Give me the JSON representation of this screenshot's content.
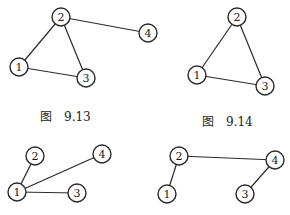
{
  "figures": [
    {
      "id": "fig-9-13",
      "caption_prefix": "图",
      "caption_number": "9.13",
      "caption_pos": [
        40,
        107
      ],
      "nodes": [
        {
          "label": "1",
          "x": 19,
          "y": 67
        },
        {
          "label": "2",
          "x": 61,
          "y": 17
        },
        {
          "label": "3",
          "x": 86,
          "y": 78
        },
        {
          "label": "4",
          "x": 148,
          "y": 33
        }
      ],
      "edges": [
        [
          "1",
          "2"
        ],
        [
          "2",
          "3"
        ],
        [
          "1",
          "3"
        ],
        [
          "2",
          "4"
        ]
      ]
    },
    {
      "id": "fig-9-14",
      "caption_prefix": "图",
      "caption_number": "9.14",
      "caption_pos": [
        202,
        112
      ],
      "nodes": [
        {
          "label": "1",
          "x": 197,
          "y": 75
        },
        {
          "label": "2",
          "x": 237,
          "y": 17
        },
        {
          "label": "3",
          "x": 265,
          "y": 86
        }
      ],
      "edges": [
        [
          "1",
          "2"
        ],
        [
          "2",
          "3"
        ],
        [
          "1",
          "3"
        ]
      ]
    },
    {
      "id": "fig-bottom-left",
      "nodes": [
        {
          "label": "1",
          "x": 17,
          "y": 192
        },
        {
          "label": "2",
          "x": 35,
          "y": 156
        },
        {
          "label": "3",
          "x": 77,
          "y": 193
        },
        {
          "label": "4",
          "x": 102,
          "y": 154
        }
      ],
      "edges": [
        [
          "1",
          "2"
        ],
        [
          "1",
          "4"
        ],
        [
          "1",
          "3"
        ]
      ]
    },
    {
      "id": "fig-bottom-right",
      "nodes": [
        {
          "label": "1",
          "x": 167,
          "y": 194
        },
        {
          "label": "2",
          "x": 179,
          "y": 156
        },
        {
          "label": "3",
          "x": 245,
          "y": 194
        },
        {
          "label": "4",
          "x": 275,
          "y": 160
        }
      ],
      "edges": [
        [
          "1",
          "2"
        ],
        [
          "2",
          "4"
        ],
        [
          "4",
          "3"
        ]
      ]
    }
  ],
  "style": {
    "node_radius": 9,
    "stroke_color": "#2a2a2a",
    "background": "#ffffff"
  }
}
